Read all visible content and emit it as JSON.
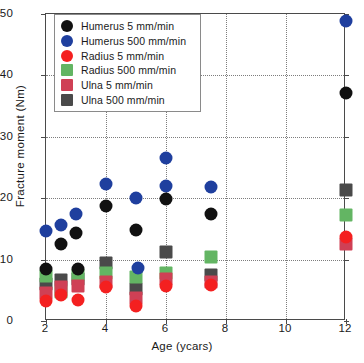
{
  "chart_data": {
    "type": "scatter",
    "title": "",
    "xlabel": "Age (ycars)",
    "ylabel": "Fracture moment (Nm)",
    "xlim": [
      2,
      12
    ],
    "ylim": [
      0,
      50
    ],
    "xticks": [
      2,
      4,
      6,
      8,
      10,
      12
    ],
    "yticks": [
      0,
      10,
      20,
      30,
      40,
      50
    ],
    "xtick_labels": [
      "2",
      "4",
      "6",
      "8",
      "10",
      "12"
    ],
    "ytick_labels": [
      "0",
      "10",
      "20",
      "30",
      "40",
      "50"
    ],
    "grid": true,
    "grid_style": "dotted",
    "legend_position": "top-left",
    "colors": {
      "humerus_5": "#111111",
      "humerus_500": "#1f3f9e",
      "radius_5": "#f42020",
      "radius_500": "#63b563",
      "ulna_5": "#cf4055",
      "ulna_500": "#4a4a4a"
    },
    "series": [
      {
        "name": "Humerus 5 mm/min",
        "marker": "circle",
        "color": "#111111",
        "points": [
          {
            "x": 2.0,
            "y": 8.4
          },
          {
            "x": 2.5,
            "y": 12.6
          },
          {
            "x": 3.0,
            "y": 14.3
          },
          {
            "x": 3.05,
            "y": 8.5
          },
          {
            "x": 4.0,
            "y": 18.8
          },
          {
            "x": 5.0,
            "y": 14.8
          },
          {
            "x": 6.0,
            "y": 19.8
          },
          {
            "x": 7.5,
            "y": 17.5
          },
          {
            "x": 12.0,
            "y": 37.2
          }
        ]
      },
      {
        "name": "Humerus 500 mm/min",
        "marker": "circle",
        "color": "#1f3f9e",
        "points": [
          {
            "x": 2.0,
            "y": 14.7
          },
          {
            "x": 2.5,
            "y": 15.6
          },
          {
            "x": 3.0,
            "y": 17.5
          },
          {
            "x": 4.0,
            "y": 22.3
          },
          {
            "x": 5.0,
            "y": 20.1
          },
          {
            "x": 5.05,
            "y": 8.6
          },
          {
            "x": 6.0,
            "y": 26.6
          },
          {
            "x": 6.0,
            "y": 22.0
          },
          {
            "x": 7.5,
            "y": 21.8
          },
          {
            "x": 12.0,
            "y": 48.9
          }
        ]
      },
      {
        "name": "Radius 5 mm/min",
        "marker": "circle",
        "color": "#f42020",
        "points": [
          {
            "x": 2.0,
            "y": 3.3
          },
          {
            "x": 2.5,
            "y": 4.3
          },
          {
            "x": 3.05,
            "y": 3.4
          },
          {
            "x": 4.0,
            "y": 5.6
          },
          {
            "x": 5.0,
            "y": 2.4
          },
          {
            "x": 6.0,
            "y": 5.7
          },
          {
            "x": 7.5,
            "y": 5.9
          },
          {
            "x": 12.0,
            "y": 13.6
          }
        ]
      },
      {
        "name": "Radius 500 mm/min",
        "marker": "square",
        "color": "#63b563",
        "points": [
          {
            "x": 2.0,
            "y": 7.4
          },
          {
            "x": 2.5,
            "y": 4.7
          },
          {
            "x": 3.05,
            "y": 7.5
          },
          {
            "x": 4.0,
            "y": 7.8
          },
          {
            "x": 5.0,
            "y": 7.2
          },
          {
            "x": 6.0,
            "y": 7.8
          },
          {
            "x": 7.5,
            "y": 10.5
          },
          {
            "x": 12.0,
            "y": 17.3
          }
        ]
      },
      {
        "name": "Ulna 5 mm/min",
        "marker": "square",
        "color": "#cf4055",
        "points": [
          {
            "x": 2.0,
            "y": 4.6
          },
          {
            "x": 2.5,
            "y": 5.6
          },
          {
            "x": 3.05,
            "y": 5.7
          },
          {
            "x": 4.0,
            "y": 6.4
          },
          {
            "x": 5.0,
            "y": 3.7
          },
          {
            "x": 6.0,
            "y": 6.8
          },
          {
            "x": 7.5,
            "y": 6.4
          },
          {
            "x": 12.0,
            "y": 12.6
          }
        ]
      },
      {
        "name": "Ulna 500 mm/min",
        "marker": "square",
        "color": "#4a4a4a",
        "points": [
          {
            "x": 2.0,
            "y": 6.0
          },
          {
            "x": 2.5,
            "y": 6.6
          },
          {
            "x": 3.05,
            "y": 6.8
          },
          {
            "x": 4.0,
            "y": 9.5
          },
          {
            "x": 5.0,
            "y": 5.2
          },
          {
            "x": 6.0,
            "y": 11.3
          },
          {
            "x": 7.5,
            "y": 7.5
          },
          {
            "x": 12.0,
            "y": 21.4
          }
        ]
      }
    ],
    "legend": [
      {
        "label": "Humerus 5 mm/min",
        "marker": "circle",
        "color": "#111111"
      },
      {
        "label": "Humerus 500 mm/min",
        "marker": "circle",
        "color": "#1f3f9e"
      },
      {
        "label": "Radius 5 mm/min",
        "marker": "circle",
        "color": "#f42020"
      },
      {
        "label": "Radius 500 mm/min",
        "marker": "square",
        "color": "#63b563"
      },
      {
        "label": "Ulna 5 mm/min",
        "marker": "square",
        "color": "#cf4055"
      },
      {
        "label": "Ulna 500 mm/min",
        "marker": "square",
        "color": "#4a4a4a"
      }
    ]
  }
}
